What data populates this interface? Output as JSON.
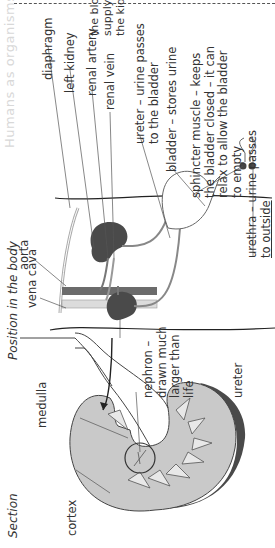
{
  "page_header": "Humans as organisms",
  "section_title": "Section",
  "position_title": "Position in the body",
  "section_labels": {
    "medulla": "medulla",
    "cortex": "cortex",
    "nephron": [
      "nephron –",
      "drawn much",
      "larger than",
      "life"
    ],
    "ureter": "ureter"
  },
  "body_labels": {
    "aorta": "aorta",
    "vena_cava": "vena cava",
    "diaphragm": "diaphragm",
    "left_kidney": "left kidney",
    "renal_artery": "renal artery",
    "renal_vein": "renal vein",
    "blood_supply": [
      "the blood",
      "supply to",
      "the kidneys"
    ],
    "ureter": [
      "ureter – urine passes",
      "to the bladder"
    ],
    "bladder": "bladder – stores urine",
    "sphincter": [
      "sphincter muscle – keeps",
      "the bladder closed – it can",
      "relax to allow the bladder",
      "to empty"
    ],
    "urethra": [
      "urethra – urine passes",
      "to outside"
    ]
  },
  "colors": {
    "kidney_dark": "#4a4a4a",
    "cortex": "#c9c9c9",
    "medulla": "#e6e6e6",
    "aorta": "#6b6b6b",
    "vena_cava": "#dcdcdc"
  }
}
